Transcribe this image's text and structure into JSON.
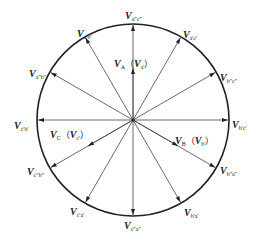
{
  "diagram": {
    "type": "space-vector-diagram",
    "center": {
      "x": 133,
      "y": 120
    },
    "radius": 96,
    "circle_color": "#222222",
    "arrow_color": "#444444",
    "outer_vectors": [
      {
        "angle_deg": 90,
        "symbol": "V",
        "subscript": "a\"c\"",
        "label_x": 125,
        "label_y": 6
      },
      {
        "angle_deg": 60,
        "symbol": "V",
        "subscript": "a'c'",
        "label_x": 183,
        "label_y": 25
      },
      {
        "angle_deg": 30,
        "symbol": "V",
        "subscript": "b\"c\"",
        "label_x": 220,
        "label_y": 68
      },
      {
        "angle_deg": 0,
        "symbol": "V",
        "subscript": "b'c'",
        "label_x": 232,
        "label_y": 115
      },
      {
        "angle_deg": -30,
        "symbol": "V",
        "subscript": "b\"a\"",
        "label_x": 220,
        "label_y": 161
      },
      {
        "angle_deg": -60,
        "symbol": "V",
        "subscript": "b'a'",
        "label_x": 184,
        "label_y": 203
      },
      {
        "angle_deg": -90,
        "symbol": "V",
        "subscript": "c\"a\"",
        "label_x": 124,
        "label_y": 216
      },
      {
        "angle_deg": -120,
        "symbol": "V",
        "subscript": "c'a'",
        "label_x": 70,
        "label_y": 202
      },
      {
        "angle_deg": -150,
        "symbol": "V",
        "subscript": "c\"b\"",
        "label_x": 27,
        "label_y": 162
      },
      {
        "angle_deg": 180,
        "symbol": "V",
        "subscript": "c'b'",
        "label_x": 14,
        "label_y": 116
      },
      {
        "angle_deg": 150,
        "symbol": "V",
        "subscript": "a\"b\"",
        "label_x": 29,
        "label_y": 64
      },
      {
        "angle_deg": 120,
        "symbol": "V",
        "subscript": "a'b'",
        "label_x": 77,
        "label_y": 24
      }
    ],
    "phase_vectors": [
      {
        "angle_deg": 90,
        "length": 52,
        "symbol": "V",
        "subscript": "A",
        "paren_symbol": "V",
        "paren_subscript": "a'",
        "label_x": 114,
        "label_y": 54
      },
      {
        "angle_deg": -30,
        "length": 52,
        "symbol": "V",
        "subscript": "B",
        "paren_symbol": "V",
        "paren_subscript": "b'",
        "label_x": 175,
        "label_y": 131
      },
      {
        "angle_deg": -150,
        "length": 52,
        "symbol": "V",
        "subscript": "C",
        "paren_symbol": "V",
        "paren_subscript": "c'",
        "label_x": 50,
        "label_y": 125
      }
    ],
    "paren_open": "（",
    "paren_close": "）"
  }
}
